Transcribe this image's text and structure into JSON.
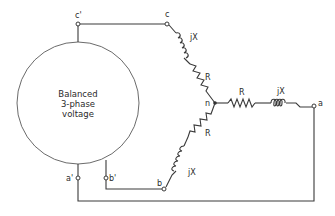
{
  "diagram": {
    "source": {
      "line1": "Balanced",
      "line2": "3-phase",
      "line3": "voltage"
    },
    "terminals": {
      "c_prime": "c'",
      "c": "c",
      "a_prime": "a'",
      "b_prime": "b'",
      "b": "b",
      "a": "a",
      "n": "n"
    },
    "components": {
      "phase_c_inductor": "jX",
      "phase_c_resistor": "R",
      "phase_a_resistor": "R",
      "phase_a_inductor": "jX",
      "phase_b_resistor": "R",
      "phase_b_inductor": "jX"
    },
    "colors": {
      "line": "#3a3a3a",
      "source_outline": "#6b6b6b",
      "background": "#ffffff"
    }
  }
}
